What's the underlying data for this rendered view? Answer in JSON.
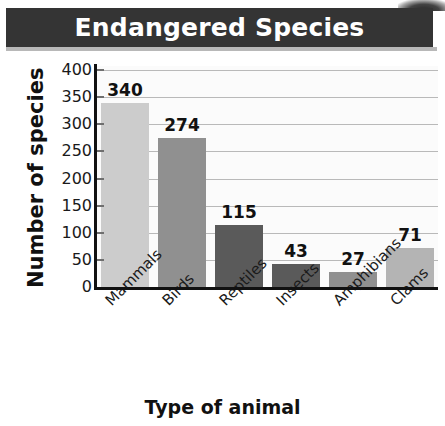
{
  "title": "Endangered Species",
  "axis_titles": {
    "x": "Type of animal",
    "y": "Number of species"
  },
  "colors": {
    "banner_background": "#343434",
    "banner_text": "#ffffff",
    "plot_background": "#fbfbfb",
    "gridline": "#b9b9b9",
    "axis_line": "#111111",
    "bar_light": "#cccccc",
    "bar_medium": "#909090",
    "bar_dark": "#5a5a5a",
    "bar_lightmedium": "#b4b4b4"
  },
  "y_ticks": [
    "0",
    "50",
    "100",
    "150",
    "200",
    "250",
    "300",
    "350",
    "400"
  ],
  "chart_data": {
    "type": "bar",
    "title": "Endangered Species",
    "xlabel": "Type of animal",
    "ylabel": "Number of species",
    "categories": [
      "Mammals",
      "Birds",
      "Reptiles",
      "Insects",
      "Amphibians",
      "Clams"
    ],
    "values": [
      340,
      274,
      115,
      43,
      27,
      71
    ],
    "bar_colors": [
      "#cccccc",
      "#909090",
      "#5a5a5a",
      "#5a5a5a",
      "#909090",
      "#b4b4b4"
    ],
    "ylim": [
      0,
      400
    ],
    "ytick_step": 50,
    "grid": true,
    "legend": false,
    "data_labels": [
      "340",
      "274",
      "115",
      "43",
      "27",
      "71"
    ]
  }
}
